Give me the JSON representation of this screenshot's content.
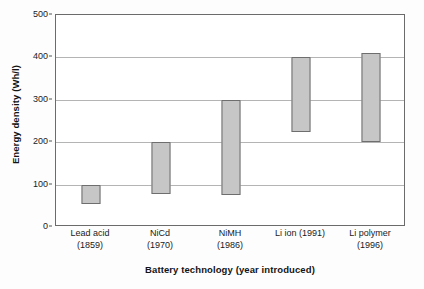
{
  "chart_data": {
    "type": "bar",
    "subtype": "floating-range-bar",
    "title": "",
    "xlabel": "Battery technology (year introduced)",
    "ylabel": "Energy density (Wh/l)",
    "ylim": [
      0,
      500
    ],
    "yticks": [
      0,
      100,
      200,
      300,
      400,
      500
    ],
    "ytick_labels": [
      "0",
      "100",
      "200",
      "300",
      "400",
      "500"
    ],
    "grid": true,
    "legend": "none",
    "categories": [
      "Lead acid (1859)",
      "NiCd (1970)",
      "NiMH (1986)",
      "Li ion (1991)",
      "Li polymer (1996)"
    ],
    "category_labels": [
      {
        "line1": "Lead acid",
        "line2": "(1859)"
      },
      {
        "line1": "NiCd",
        "line2": "(1970)"
      },
      {
        "line1": "NiMH",
        "line2": "(1986)"
      },
      {
        "line1": "Li ion (1991)",
        "line2": ""
      },
      {
        "line1": "Li polymer",
        "line2": "(1996)"
      }
    ],
    "series": [
      {
        "name": "Energy density range",
        "low": [
          55,
          78,
          75,
          225,
          200
        ],
        "high": [
          100,
          200,
          300,
          400,
          410
        ]
      }
    ],
    "bar_fill_color": "#c6c6c6",
    "bar_border_color": "#6e6e6e",
    "gridline_color": "#b4b4b4",
    "axis_color": "#6b6b6b"
  }
}
